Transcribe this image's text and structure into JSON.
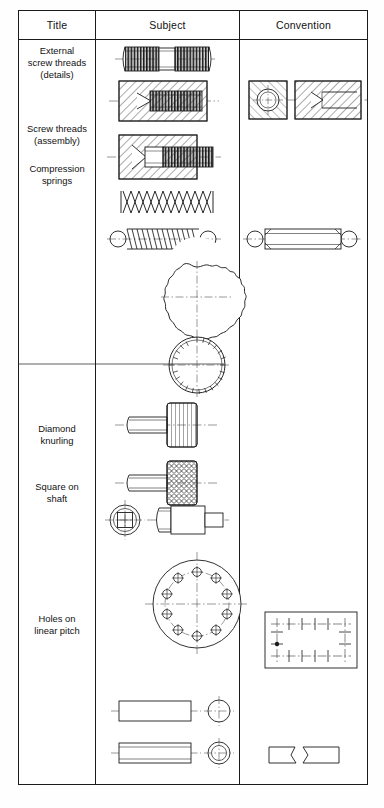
{
  "document": {
    "kind": "engineering-drawing-conventions-table",
    "orientation": "portrait"
  },
  "table": {
    "headers": [
      {
        "key": "title",
        "label": "Title"
      },
      {
        "key": "subject",
        "label": "Subject"
      },
      {
        "key": "convention",
        "label": "Convention"
      }
    ],
    "rows": [
      {
        "id": "external-screw-threads",
        "title": "External\nscrew threads\n(details)",
        "title_lines": [
          "External",
          "screw threads",
          "(details)"
        ],
        "subject_items": [
          "double-ended-stud-with-threads",
          "sectioned-tapped-blind-hole"
        ],
        "convention_items": [
          "tapped-hole-end-view-square",
          "tapped-hole-section-simplified"
        ]
      },
      {
        "id": "screw-threads-assembly",
        "title": "Screw threads\n(assembly)",
        "title_lines": [
          "Screw threads",
          "(assembly)"
        ],
        "subject_items": [
          "screw-in-tapped-hole-assembly-section"
        ],
        "convention_items": []
      },
      {
        "id": "compression-springs",
        "title": "Compression\nsprings",
        "title_lines": [
          "Compression",
          "springs"
        ],
        "subject_items": [
          "helical-compression-spring",
          "extension-spring-with-hook-ends"
        ],
        "convention_items": [
          "extension-spring-simplified-outline"
        ]
      },
      {
        "id": "diamond-knurling",
        "title": "Diamond\nknurling",
        "title_lines": [
          "Diamond",
          "knurling"
        ],
        "subject_items": [
          "coarse-knurl-end-view-circle",
          "fine-knurl-end-view-circle",
          "thumbscrew-straight-knurl",
          "thumbscrew-diamond-knurl"
        ],
        "convention_items": []
      },
      {
        "id": "square-on-shaft",
        "title": "Square on\nshaft",
        "title_lines": [
          "Square on",
          "shaft"
        ],
        "subject_items": [
          "square-on-shaft-end-view",
          "stepped-shaft-with-square-section"
        ],
        "convention_items": []
      },
      {
        "id": "holes-on-linear-pitch",
        "title": "Holes on\nlinear pitch",
        "title_lines": [
          "Holes on",
          "linear pitch"
        ],
        "subject_items": [
          "bolt-circle-ten-holes-pitch-circle",
          "plain-rod-with-end-circle",
          "hollow-rod-with-end-circle"
        ],
        "convention_items": [
          "plate-with-linear-pitch-hole-centres",
          "interrupted-broken-view"
        ]
      }
    ]
  },
  "style": {
    "ink": "#1b1b1b",
    "line": "#222222",
    "centreline": "#555555",
    "hatch": "#2a2a2a",
    "paper": "#ffffff"
  }
}
